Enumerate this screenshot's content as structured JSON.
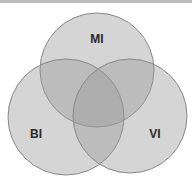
{
  "diagram": {
    "type": "venn",
    "sets": [
      {
        "id": "mi",
        "label": "MI",
        "cx": 97,
        "cy": 70,
        "r": 57
      },
      {
        "id": "bi",
        "label": "BI",
        "cx": 66,
        "cy": 117,
        "r": 58
      },
      {
        "id": "vi",
        "label": "VI",
        "cx": 130,
        "cy": 116,
        "r": 57
      }
    ],
    "colors": {
      "fill": "#9a9a9a",
      "fill_opacity": 0.42,
      "stroke": "#888888",
      "label": "#2a2a2a",
      "top_bar": "#bdbdbd"
    }
  }
}
